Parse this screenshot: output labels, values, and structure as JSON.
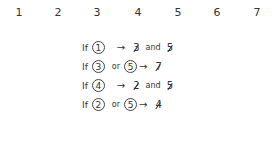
{
  "numbers": [
    {
      "label": "1",
      "x": 19
    },
    {
      "label": "2",
      "x": 58
    },
    {
      "label": "3",
      "x": 97
    },
    {
      "label": "4",
      "x": 138
    },
    {
      "label": "5",
      "x": 178
    },
    {
      "label": "6",
      "x": 217
    },
    {
      "label": "7",
      "x": 257
    }
  ],
  "rules": [
    {
      "if": "If",
      "cond": [
        "1"
      ],
      "cond_join": "",
      "arrow": "→",
      "results": [
        "3",
        "5"
      ],
      "result_join": "and"
    },
    {
      "if": "If",
      "cond": [
        "3",
        "5"
      ],
      "cond_join": "or",
      "arrow": "→",
      "results": [
        "7"
      ],
      "result_join": ""
    },
    {
      "if": "If",
      "cond": [
        "4"
      ],
      "cond_join": "",
      "arrow": "→",
      "results": [
        "2",
        "5"
      ],
      "result_join": "and"
    },
    {
      "if": "If",
      "cond": [
        "2",
        "5"
      ],
      "cond_join": "or",
      "arrow": "→",
      "results": [
        "4"
      ],
      "result_join": ""
    }
  ],
  "labels": {
    "r0": {
      "if": "If",
      "c1": "1",
      "arrow": "→",
      "res1": "3",
      "join": "and",
      "res2": "5"
    },
    "r1": {
      "if": "If",
      "c1": "3",
      "or": "or",
      "c2": "5",
      "arrow": "→",
      "res1": "7"
    },
    "r2": {
      "if": "If",
      "c1": "4",
      "arrow": "→",
      "res1": "2",
      "join": "and",
      "res2": "5"
    },
    "r3": {
      "if": "If",
      "c1": "2",
      "or": "or",
      "c2": "5",
      "arrow": "→",
      "res1": "4"
    }
  }
}
